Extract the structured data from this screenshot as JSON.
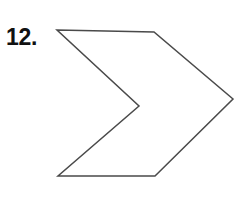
{
  "page": {
    "background_color": "#ffffff",
    "width": 239,
    "height": 215
  },
  "problem": {
    "number_label": "12.",
    "label_color": "#111111"
  },
  "figure": {
    "name": "concave-chevron-arrow-polygon",
    "stroke_color": "#4a4a4a",
    "fill_color": "none",
    "stroke_width": 1.5,
    "vertex_count": 6,
    "vertices": [
      {
        "name": "top-left",
        "x": 57,
        "y": 30
      },
      {
        "name": "top-right-corner",
        "x": 154,
        "y": 32
      },
      {
        "name": "right-tip",
        "x": 233,
        "y": 99
      },
      {
        "name": "bottom-right-corner",
        "x": 155,
        "y": 176
      },
      {
        "name": "bottom-left",
        "x": 58,
        "y": 176
      },
      {
        "name": "inner-notch",
        "x": 139,
        "y": 106
      }
    ],
    "points_attr": "57,30 154,32 233,99 155,176 58,176 139,106"
  }
}
